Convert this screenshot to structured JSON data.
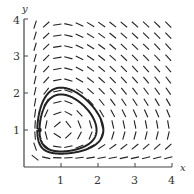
{
  "chart_data": {
    "type": "direction_field",
    "title": "",
    "xlabel": "x",
    "ylabel": "y",
    "xlim": [
      0,
      4
    ],
    "ylim": [
      0,
      4
    ],
    "xticks": [
      "1",
      "2",
      "3",
      "4"
    ],
    "yticks": [
      "1",
      "2",
      "3",
      "4"
    ],
    "grid": false,
    "equilibrium": [
      1,
      1
    ],
    "field": "dx/dt = x(1 - y), dy/dt = y(x - 1) (Lotka-Volterra type slope field)",
    "trajectory": {
      "description": "closed orbit around equilibrium (1,1), drawn with double thick line",
      "start_point": [
        0.4,
        1.0
      ],
      "x_range": [
        0.35,
        2.3
      ],
      "y_range": [
        0.45,
        2.0
      ]
    }
  },
  "labels": {
    "x_axis": "x",
    "y_axis": "y",
    "x_ticks": [
      "1",
      "2",
      "3",
      "4"
    ],
    "y_ticks": [
      "1",
      "2",
      "3",
      "4"
    ]
  },
  "colors": {
    "ink": "#222222",
    "axis": "#444444"
  }
}
